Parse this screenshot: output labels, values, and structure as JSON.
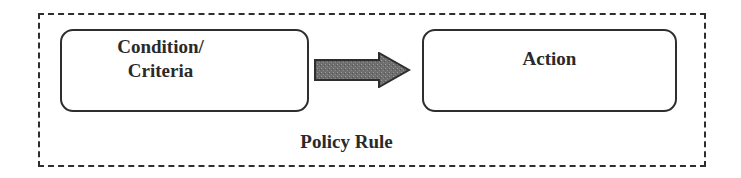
{
  "diagram": {
    "container_label": "Policy Rule",
    "nodes": [
      {
        "id": "condition",
        "label": "Condition/\nCriteria",
        "lines": [
          "Condition/",
          "Criteria"
        ]
      },
      {
        "id": "action",
        "label": "Action"
      }
    ],
    "edges": [
      {
        "from": "condition",
        "to": "action",
        "style": "block-arrow"
      }
    ],
    "colors": {
      "stroke": "#2e2e2e",
      "arrow_fill": "#6b6b6b",
      "text": "#2a2a2a"
    }
  }
}
